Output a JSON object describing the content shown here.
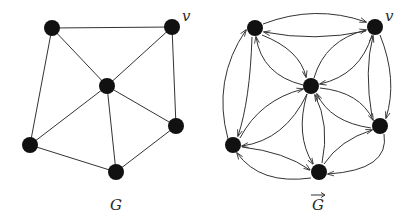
{
  "figure": {
    "left_graph": {
      "label": "G",
      "vertex_label": "v",
      "vertices": [
        {
          "id": "a",
          "x": 52,
          "y": 28
        },
        {
          "id": "v",
          "x": 172,
          "y": 27
        },
        {
          "id": "c",
          "x": 107,
          "y": 86
        },
        {
          "id": "d",
          "x": 30,
          "y": 145
        },
        {
          "id": "e",
          "x": 116,
          "y": 172
        },
        {
          "id": "f",
          "x": 176,
          "y": 126
        }
      ],
      "edges": [
        [
          "a",
          "v"
        ],
        [
          "a",
          "c"
        ],
        [
          "a",
          "d"
        ],
        [
          "v",
          "c"
        ],
        [
          "v",
          "f"
        ],
        [
          "c",
          "d"
        ],
        [
          "c",
          "e"
        ],
        [
          "c",
          "f"
        ],
        [
          "d",
          "e"
        ],
        [
          "e",
          "f"
        ]
      ]
    },
    "right_graph": {
      "label": "G",
      "label_accent": "→",
      "vertex_label": "v",
      "vertices": [
        {
          "id": "a",
          "x": 255,
          "y": 28
        },
        {
          "id": "v",
          "x": 375,
          "y": 27
        },
        {
          "id": "c",
          "x": 311,
          "y": 86
        },
        {
          "id": "d",
          "x": 233,
          "y": 145
        },
        {
          "id": "e",
          "x": 319,
          "y": 172
        },
        {
          "id": "f",
          "x": 380,
          "y": 126
        }
      ],
      "arcs": "each undirected edge of G replaced by two opposite directed arcs"
    },
    "colors": {
      "vertex": "#111111",
      "edge": "#333333",
      "label": "#2a2a2a"
    }
  }
}
